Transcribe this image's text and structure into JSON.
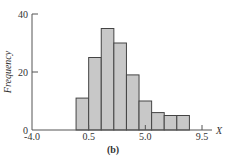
{
  "chart_data": {
    "type": "bar",
    "subtype": "histogram",
    "title": "",
    "caption": "(b)",
    "xlabel": "X",
    "ylabel": "Frequency",
    "bin_edges": [
      -0.5,
      0.5,
      1.5,
      2.5,
      3.5,
      4.5,
      5.5,
      6.5,
      7.5,
      8.5
    ],
    "values": [
      11,
      25,
      35,
      30,
      19,
      10,
      6,
      5,
      5
    ],
    "xlim": [
      -4.0,
      9.5
    ],
    "ylim": [
      0,
      40
    ],
    "x_ticks": [
      "-4.0",
      "0.5",
      "5.0",
      "9.5"
    ],
    "x_tick_values": [
      -4.0,
      0.5,
      5.0,
      9.5
    ],
    "y_ticks": [
      "0",
      "20",
      "40"
    ],
    "y_tick_values": [
      0,
      20,
      40
    ],
    "grid": false,
    "legend": null,
    "colors": {
      "bar_fill": "#c8c8c8",
      "bar_edge": "#444444",
      "axis": "#555555"
    }
  }
}
